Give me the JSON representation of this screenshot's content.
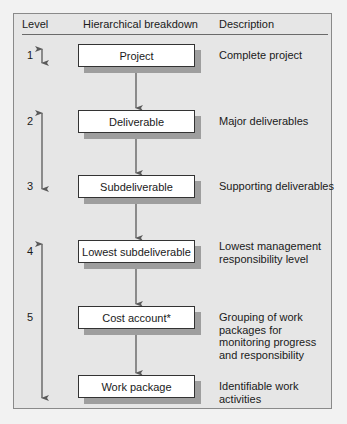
{
  "header": {
    "level_label": "Level",
    "breakdown_label": "Hierarchical breakdown",
    "description_label": "Description"
  },
  "rows": [
    {
      "level": "1",
      "node": "Project",
      "description": "Complete project"
    },
    {
      "level": "2",
      "node": "Deliverable",
      "description": "Major deliverables"
    },
    {
      "level": "3",
      "node": "Subdeliverable",
      "description": "Supporting deliverables"
    },
    {
      "level": "4",
      "node": "Lowest subdeliverable",
      "description_lines": [
        "Lowest management",
        "responsibility level"
      ]
    },
    {
      "level": "5",
      "node": "Cost account*",
      "description_lines": [
        "Grouping of work",
        "packages for",
        "monitoring progress",
        "and responsibility"
      ]
    },
    {
      "level": "",
      "node": "Work package",
      "description_lines": [
        "Identifiable work",
        "activities"
      ]
    }
  ],
  "level_arrows": [
    {
      "from_level": "1",
      "to_level": "1",
      "type": "double"
    },
    {
      "from_level": "2",
      "to_level": "3",
      "type": "double"
    },
    {
      "from_level": "4",
      "to_level": "work package",
      "type": "double"
    }
  ],
  "colors": {
    "frame_bg": "#e6e6e6",
    "box_bg": "#ffffff",
    "shadow": "#9e9e9e",
    "arrow": "#5a5a5a"
  }
}
